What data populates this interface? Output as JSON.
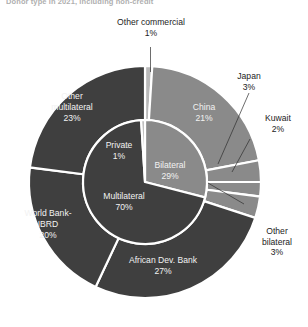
{
  "title": "Donor type in 2021, including non-credit",
  "colors": {
    "dark_gray": "#3f3f3f",
    "mid_gray": "#8a8a8a",
    "light_gray": "#b9b9b9",
    "divider": "#ffffff",
    "label_text": "#232323",
    "slice_text": "#f2f2f2"
  },
  "chart_data": {
    "type": "pie",
    "title": "Donor type in 2021, including non-credit",
    "subtype": "nested-donut",
    "legend_position": "none",
    "rings": [
      {
        "name": "inner",
        "categories": [
          "Bilateral",
          "Multilateral",
          "Private"
        ],
        "values": [
          29,
          70,
          1
        ],
        "units": "%"
      },
      {
        "name": "outer",
        "categories": [
          "Other commercial",
          "China",
          "Japan",
          "Kuwait",
          "Other bilateral",
          "African Dev. Bank",
          "World Bank-IBRD",
          "Other multilateral"
        ],
        "values": [
          1,
          21,
          3,
          2,
          3,
          27,
          20,
          23
        ],
        "units": "%"
      }
    ]
  },
  "inner_labels": [
    {
      "name": "Private",
      "value": "1%",
      "text": "Private\n1%"
    },
    {
      "name": "Bilateral",
      "value": "29%",
      "text": "Bilateral\n29%"
    },
    {
      "name": "Multilateral",
      "value": "70%",
      "text": "Multilateral\n70%"
    }
  ],
  "outer_labels": [
    {
      "name": "China",
      "value": "21%",
      "text": "China\n21%",
      "placement": "inside"
    },
    {
      "name": "African Dev. Bank",
      "value": "27%",
      "text": "African Dev. Bank\n27%",
      "placement": "inside"
    },
    {
      "name": "World Bank-IBRD",
      "value": "20%",
      "text": "World Bank-\nIBRD\n20%",
      "placement": "inside"
    },
    {
      "name": "Other multilateral",
      "value": "23%",
      "text": "Other\nmultilateral\n23%",
      "placement": "inside"
    }
  ],
  "callouts": [
    {
      "name": "Other commercial",
      "value": "1%",
      "text": "Other commercial\n1%"
    },
    {
      "name": "Japan",
      "value": "3%",
      "text": "Japan\n3%"
    },
    {
      "name": "Kuwait",
      "value": "2%",
      "text": "Kuwait\n2%"
    },
    {
      "name": "Other bilateral",
      "value": "3%",
      "text": "Other\nbilateral\n3%"
    }
  ]
}
